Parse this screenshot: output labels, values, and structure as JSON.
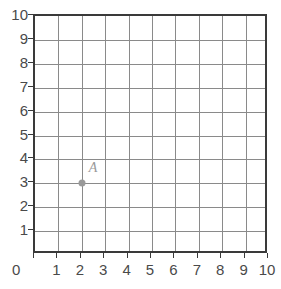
{
  "chart_data": {
    "type": "scatter",
    "title": "",
    "xlabel": "",
    "ylabel": "",
    "xlim": [
      0,
      10
    ],
    "ylim": [
      0,
      10
    ],
    "grid": true,
    "legend": "none",
    "x_ticks": [
      "0",
      "1",
      "2",
      "3",
      "4",
      "5",
      "6",
      "7",
      "8",
      "9",
      "10"
    ],
    "y_ticks": [
      "0",
      "1",
      "2",
      "3",
      "4",
      "5",
      "6",
      "7",
      "8",
      "9",
      "10"
    ],
    "x_tick_values": [
      0,
      1,
      2,
      3,
      4,
      5,
      6,
      7,
      8,
      9,
      10
    ],
    "y_tick_values": [
      0,
      1,
      2,
      3,
      4,
      5,
      6,
      7,
      8,
      9,
      10
    ],
    "points": [
      {
        "label": "A",
        "x": 2,
        "y": 3
      }
    ],
    "origin_label": "0"
  },
  "style": {
    "gridline_color": "#8a8a8a",
    "border_color": "#3a3a3a",
    "tick_label_color": "#4a4a4a",
    "point_color": "#9a9a9a",
    "background_color": "#ffffff"
  }
}
